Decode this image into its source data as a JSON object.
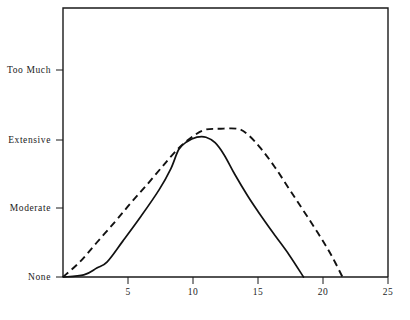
{
  "chart_data": {
    "type": "line",
    "title": "",
    "subtitle": "",
    "xlabel": "",
    "ylabel": "",
    "xlim": [
      0,
      25
    ],
    "xticks": [
      5,
      10,
      15,
      20,
      25
    ],
    "xticklabels": [
      "5",
      "10",
      "15",
      "20",
      "25"
    ],
    "ylim": [
      0,
      3.45
    ],
    "yticks": [
      0,
      1,
      2,
      3
    ],
    "yticklabels": [
      "None",
      "Moderate",
      "Extensive",
      "Too Much"
    ],
    "grid": false,
    "legend": "none",
    "series": [
      {
        "name": "solid-curve",
        "style": "solid",
        "color": "#111111",
        "points": [
          [
            0.0,
            0.0
          ],
          [
            1.6,
            0.03
          ],
          [
            2.6,
            0.13
          ],
          [
            3.4,
            0.22
          ],
          [
            4.6,
            0.52
          ],
          [
            6.0,
            0.88
          ],
          [
            7.4,
            1.27
          ],
          [
            8.3,
            1.58
          ],
          [
            8.9,
            1.86
          ],
          [
            9.5,
            1.97
          ],
          [
            10.3,
            2.04
          ],
          [
            11.0,
            2.04
          ],
          [
            11.7,
            1.96
          ],
          [
            12.4,
            1.78
          ],
          [
            13.2,
            1.5
          ],
          [
            14.2,
            1.18
          ],
          [
            15.0,
            0.95
          ],
          [
            16.2,
            0.63
          ],
          [
            17.4,
            0.32
          ],
          [
            18.5,
            0.0
          ]
        ]
      },
      {
        "name": "dashed-curve",
        "style": "dashed",
        "color": "#111111",
        "points": [
          [
            0.0,
            0.0
          ],
          [
            1.3,
            0.22
          ],
          [
            2.6,
            0.5
          ],
          [
            4.0,
            0.8
          ],
          [
            5.2,
            1.07
          ],
          [
            6.4,
            1.33
          ],
          [
            7.6,
            1.6
          ],
          [
            8.5,
            1.8
          ],
          [
            9.3,
            1.95
          ],
          [
            10.2,
            2.08
          ],
          [
            11.0,
            2.15
          ],
          [
            12.0,
            2.16
          ],
          [
            13.4,
            2.16
          ],
          [
            14.2,
            2.08
          ],
          [
            15.2,
            1.88
          ],
          [
            16.3,
            1.6
          ],
          [
            17.4,
            1.28
          ],
          [
            18.5,
            0.96
          ],
          [
            19.6,
            0.64
          ],
          [
            20.6,
            0.33
          ],
          [
            21.5,
            0.0
          ]
        ]
      }
    ],
    "annotations": []
  },
  "axes": {
    "y_labels": [
      {
        "id": "too-much",
        "text": "Too Much"
      },
      {
        "id": "extensive",
        "text": "Extensive"
      },
      {
        "id": "moderate",
        "text": "Moderate"
      },
      {
        "id": "none",
        "text": "None"
      }
    ],
    "x_labels": [
      {
        "id": "x5",
        "text": "5"
      },
      {
        "id": "x10",
        "text": "10"
      },
      {
        "id": "x15",
        "text": "15"
      },
      {
        "id": "x20",
        "text": "20"
      },
      {
        "id": "x25",
        "text": "25"
      }
    ]
  },
  "caption": {
    "text": ""
  }
}
